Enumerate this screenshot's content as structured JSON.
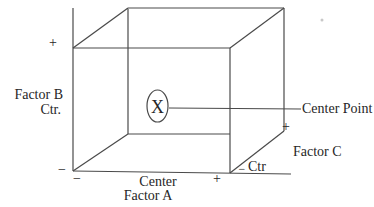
{
  "diagram": {
    "center_point": {
      "symbol": "X",
      "label": "Center Point"
    },
    "factor_a": {
      "name_line1": "Center",
      "name_line2": "Factor A",
      "low": "−",
      "high": "+"
    },
    "factor_b": {
      "name_line1": "Factor B",
      "name_line2": "Ctr.",
      "low": "−",
      "high": "+"
    },
    "factor_c": {
      "name": "Factor C",
      "center_label": "Ctr",
      "low": "−",
      "high": "+"
    },
    "colors": {
      "background": "#ffffff",
      "line": "#4a4a4a",
      "text": "#262626"
    }
  }
}
